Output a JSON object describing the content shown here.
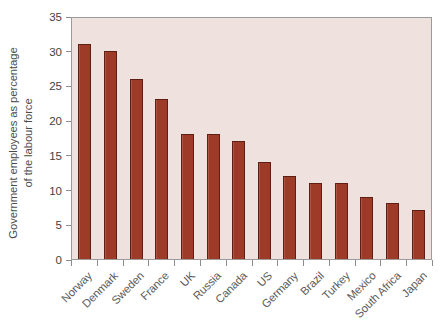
{
  "chart_data": {
    "type": "bar",
    "title": "",
    "subtitle": "",
    "xlabel": "",
    "ylabel": "Government employees as percentage of the labour force",
    "ylabel_lines": [
      "Government employees as percentage",
      "of the labour force"
    ],
    "categories": [
      "Norway",
      "Denmark",
      "Sweden",
      "France",
      "UK",
      "Russia",
      "Canada",
      "US",
      "Germany",
      "Brazil",
      "Turkey",
      "Mexico",
      "South Africa",
      "Japan"
    ],
    "values": [
      31,
      30,
      26,
      23,
      18,
      18,
      17,
      14,
      12,
      11,
      11,
      9,
      8,
      7
    ],
    "ylim": [
      0,
      35
    ],
    "yticks": [
      0,
      5,
      10,
      15,
      20,
      25,
      30,
      35
    ],
    "ytick_labels": [
      "0",
      "5",
      "10",
      "15",
      "20",
      "25",
      "30",
      "35"
    ],
    "grid": false,
    "legend": null,
    "legend_position": "none",
    "bar_color": "#9e3a28",
    "bar_edge_color": "#5e1e14",
    "plot_background": "#efe1dd",
    "page_background": "#ffffff",
    "axis_color": "#8c8c8c",
    "tick_label_color": "#3f3f3f",
    "category_label_color": "#5a5a5a",
    "category_label_rotation": -45
  }
}
